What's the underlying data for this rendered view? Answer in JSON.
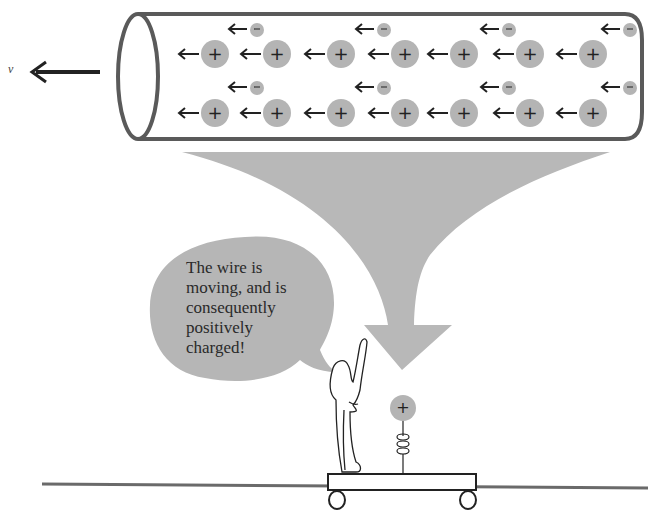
{
  "diagram": {
    "velocity_label": "v",
    "speech_bubble": {
      "lines": [
        "The wire is",
        "moving, and is",
        "consequently",
        "positively",
        "charged!"
      ]
    },
    "wire": {
      "positive_charge_symbol": "+",
      "negative_charge_symbol": "−",
      "positive_rows_y": [
        54,
        113
      ],
      "positive_x": [
        215,
        277,
        341,
        405,
        464,
        530,
        593
      ],
      "negative_rows_y": [
        30,
        88
      ],
      "negative_x": [
        257,
        384,
        509,
        630
      ]
    },
    "test_charge_symbol": "+",
    "colors": {
      "charge_fill": "#b4b4b4",
      "tube_stroke": "#5a5a5a",
      "arrow_fill": "#b8b8b8",
      "bubble_fill": "#b6b6b6",
      "ground_line": "#6a6a6a",
      "ink": "#222222"
    }
  }
}
